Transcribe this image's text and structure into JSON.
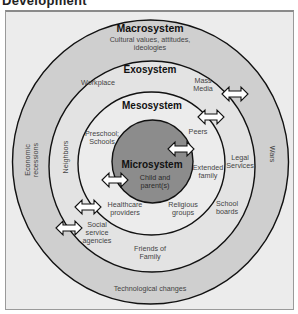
{
  "page_title": "Development",
  "diagram": {
    "colors": {
      "frame_bg": "#ececec",
      "macro_ring": "#cfcfcf",
      "exo_ring": "#e2e2e2",
      "meso_ring": "#ebebeb",
      "micro_core": "#8c8c8c",
      "stroke": "#111111",
      "arrow_fill": "#ffffff"
    },
    "systems": {
      "macrosystem": {
        "title": "Macrosystem",
        "subtitle_line1": "Cultural values, attitudes,",
        "subtitle_line2": "ideologies",
        "items": {
          "economic_line1": "Economic",
          "economic_line2": "recessions",
          "wars": "Wars",
          "technological": "Technological changes"
        }
      },
      "exosystem": {
        "title": "Exosystem",
        "items": {
          "workplace": "Workplace",
          "mass_media_line1": "Mass",
          "mass_media_line2": "Media",
          "neighbors": "Neighbors",
          "legal_line1": "Legal",
          "legal_line2": "Services",
          "school_boards_line1": "School",
          "school_boards_line2": "boards",
          "social_line1": "Social",
          "social_line2": "service",
          "social_line3": "agencies",
          "friends_line1": "Friends of",
          "friends_line2": "Family"
        }
      },
      "mesosystem": {
        "title": "Mesosystem",
        "items": {
          "preschool_line1": "Preschool;",
          "preschool_line2": "Schools",
          "peers": "Peers",
          "extended_line1": "Extended",
          "extended_line2": "family",
          "healthcare_line1": "Healthcare",
          "healthcare_line2": "providers",
          "religious_line1": "Religious",
          "religious_line2": "groups"
        }
      },
      "microsystem": {
        "title": "Microsystem",
        "subtitle_line1": "Child and",
        "subtitle_line2": "parent(s)"
      }
    },
    "arrows": [
      {
        "name": "mass-media-arrow",
        "x": 222,
        "y": 93
      },
      {
        "name": "peers-arrow",
        "x": 198,
        "y": 116
      },
      {
        "name": "extended-family-arrow",
        "x": 168,
        "y": 148
      },
      {
        "name": "child-arrow",
        "x": 102,
        "y": 180
      },
      {
        "name": "healthcare-arrow",
        "x": 75,
        "y": 207
      },
      {
        "name": "social-service-arrow",
        "x": 56,
        "y": 228
      }
    ]
  }
}
